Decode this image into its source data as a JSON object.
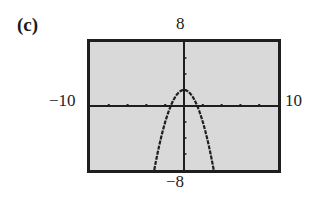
{
  "figure": {
    "part_label": "(c)",
    "window_labels": {
      "xmin": "−10",
      "xmax": "10",
      "ymin": "−8",
      "ymax": "8"
    },
    "colors": {
      "screen_background": "#d9d9d9",
      "frame": "#1e1e1e",
      "axis": "#1e1e1e",
      "curve": "#1e1e1e"
    }
  },
  "chart_data": {
    "type": "line",
    "title": "(c)",
    "xlabel": "",
    "ylabel": "",
    "function": "y = 2 - x^2",
    "xlim": [
      -10,
      10
    ],
    "ylim": [
      -8,
      8
    ],
    "xscl": 2,
    "yscl": 2,
    "grid": false,
    "legend": null,
    "tick_labels": {
      "x": [
        "−10",
        "10"
      ],
      "y": [
        "−8",
        "8"
      ]
    },
    "series": [
      {
        "name": "y = 2 - x^2",
        "style": "dotted/pixelated calculator plot",
        "x": [
          -3.16,
          -3,
          -2.5,
          -2,
          -1.5,
          -1.414,
          -1,
          -0.5,
          0,
          0.5,
          1,
          1.414,
          1.5,
          2,
          2.5,
          3,
          3.16
        ],
        "y": [
          -8,
          -7,
          -4.25,
          -2,
          -0.25,
          0,
          1,
          1.75,
          2,
          1.75,
          1,
          0,
          -0.25,
          -2,
          -4.25,
          -7,
          -8
        ]
      }
    ],
    "annotations": {
      "vertex": [
        0,
        2
      ],
      "x_intercepts": [
        -1.414,
        1.414
      ]
    }
  }
}
